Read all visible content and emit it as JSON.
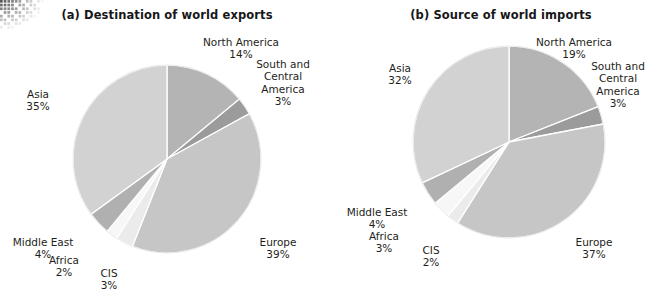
{
  "figure": {
    "background_color": "#ffffff",
    "text_color": "#1e1e20"
  },
  "decoration": {
    "corner_halftone": "halftone-dots-decoration"
  },
  "chart_data": [
    {
      "type": "pie",
      "id": "destination-of-world-exports",
      "title": "(a) Destination of world exports",
      "xlabel": "",
      "ylabel": "",
      "legend": "none (direct labels around pie)",
      "start_angle_deg": 0,
      "direction": "clockwise",
      "categories": [
        "North America",
        "South and Central America",
        "Europe",
        "CIS",
        "Africa",
        "Middle East",
        "Asia"
      ],
      "values": [
        14,
        3,
        39,
        3,
        2,
        4,
        35
      ],
      "value_labels": [
        "14%",
        "3%",
        "39%",
        "3%",
        "2%",
        "4%",
        "35%"
      ],
      "colors": [
        "#b4b4b4",
        "#9b9b9b",
        "#c6c6c6",
        "#ebebeb",
        "#f7f7f7",
        "#b0b0b0",
        "#d2d2d2"
      ],
      "labels": [
        {
          "name": "North America",
          "pct": "14%",
          "text": "North America\n14%"
        },
        {
          "name": "South and Central America",
          "pct": "3%",
          "text": "South and\nCentral\nAmerica\n3%"
        },
        {
          "name": "Europe",
          "pct": "39%",
          "text": "Europe\n39%"
        },
        {
          "name": "CIS",
          "pct": "3%",
          "text": "CIS\n3%"
        },
        {
          "name": "Africa",
          "pct": "2%",
          "text": "Africa\n2%"
        },
        {
          "name": "Middle East",
          "pct": "4%",
          "text": "Middle East\n4%"
        },
        {
          "name": "Asia",
          "pct": "35%",
          "text": "Asia\n35%"
        }
      ]
    },
    {
      "type": "pie",
      "id": "source-of-world-imports",
      "title": "(b) Source of world imports",
      "xlabel": "",
      "ylabel": "",
      "legend": "none (direct labels around pie)",
      "start_angle_deg": 0,
      "direction": "clockwise",
      "categories": [
        "North America",
        "South and Central America",
        "Europe",
        "CIS",
        "Africa",
        "Middle East",
        "Asia"
      ],
      "values": [
        19,
        3,
        37,
        2,
        3,
        4,
        32
      ],
      "value_labels": [
        "19%",
        "3%",
        "37%",
        "2%",
        "3%",
        "4%",
        "32%"
      ],
      "colors": [
        "#b4b4b4",
        "#9b9b9b",
        "#c6c6c6",
        "#ebebeb",
        "#f7f7f7",
        "#b0b0b0",
        "#d2d2d2"
      ],
      "labels": [
        {
          "name": "North America",
          "pct": "19%",
          "text": "North America\n19%"
        },
        {
          "name": "South and Central America",
          "pct": "3%",
          "text": "South and\nCentral\nAmerica\n3%"
        },
        {
          "name": "Europe",
          "pct": "37%",
          "text": "Europe\n37%"
        },
        {
          "name": "CIS",
          "pct": "2%",
          "text": "CIS\n2%"
        },
        {
          "name": "Africa",
          "pct": "3%",
          "text": "Africa\n3%"
        },
        {
          "name": "Middle East",
          "pct": "4%",
          "text": "Middle East\n4%"
        },
        {
          "name": "Asia",
          "pct": "32%",
          "text": "Asia\n32%"
        }
      ]
    }
  ]
}
